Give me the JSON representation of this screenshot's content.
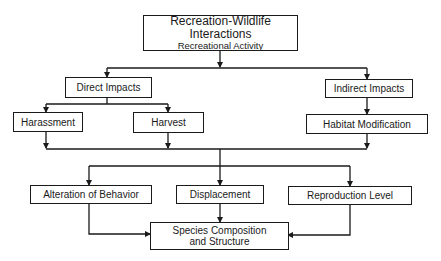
{
  "diagram": {
    "root": {
      "line1": "Recreation-Wildlife",
      "line2": "Interactions",
      "line3": "Recreational Activity"
    },
    "direct": "Direct Impacts",
    "indirect": "Indirect Impacts",
    "harassment": "Harassment",
    "harvest": "Harvest",
    "habitat": "Habitat Modification",
    "alteration": "Alteration of Behavior",
    "displacement": "Displacement",
    "reproduction": "Reproduction Level",
    "species": {
      "line1": "Species Composition",
      "line2": "and Structure"
    }
  }
}
